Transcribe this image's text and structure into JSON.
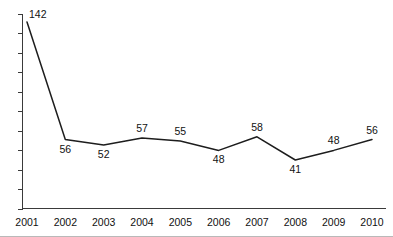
{
  "chart_data": {
    "type": "line",
    "title": "",
    "xlabel": "",
    "ylabel": "",
    "categories": [
      "2001",
      "2002",
      "2003",
      "2004",
      "2005",
      "2006",
      "2007",
      "2008",
      "2009",
      "2010"
    ],
    "values": [
      142,
      56,
      52,
      57,
      55,
      48,
      58,
      41,
      48,
      56
    ],
    "data_labels": [
      "142",
      "56",
      "52",
      "57",
      "55",
      "48",
      "58",
      "41",
      "48",
      "56"
    ],
    "label_positions": [
      "right",
      "below",
      "below",
      "above",
      "above",
      "below",
      "above",
      "below",
      "above",
      "above"
    ],
    "ylim": [
      0,
      150
    ],
    "y_tick_count": 11,
    "y_tick_labels_shown": false,
    "grid": false,
    "legend": false,
    "series_color": "#1d1d1d",
    "axis_color": "#3a3a3a",
    "background_color": "#ffffff"
  },
  "axes": {
    "x_tick_labels": [
      "2001",
      "2002",
      "2003",
      "2004",
      "2005",
      "2006",
      "2007",
      "2008",
      "2009",
      "2010"
    ]
  }
}
